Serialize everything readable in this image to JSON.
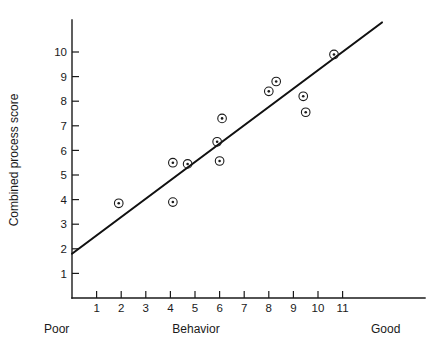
{
  "chart_data": {
    "type": "scatter",
    "title": "",
    "xlabel": "Behavior",
    "ylabel": "Combined process score",
    "xlim": [
      0,
      14.6
    ],
    "ylim": [
      0,
      11.6
    ],
    "grid": false,
    "legend": null,
    "x_ticks": [
      1,
      2,
      3,
      4,
      5,
      6,
      7,
      8,
      9,
      10,
      11
    ],
    "y_ticks": [
      1,
      2,
      3,
      4,
      5,
      6,
      7,
      8,
      9,
      10
    ],
    "x_axis_low_label": "Poor",
    "x_axis_high_label": "Good",
    "points": [
      {
        "x": 1.9,
        "y": 3.85
      },
      {
        "x": 4.1,
        "y": 3.9
      },
      {
        "x": 4.1,
        "y": 5.5
      },
      {
        "x": 4.7,
        "y": 5.45
      },
      {
        "x": 5.9,
        "y": 6.35
      },
      {
        "x": 6.0,
        "y": 5.57
      },
      {
        "x": 6.1,
        "y": 7.3
      },
      {
        "x": 8.0,
        "y": 8.4
      },
      {
        "x": 8.3,
        "y": 8.8
      },
      {
        "x": 9.4,
        "y": 8.2
      },
      {
        "x": 9.5,
        "y": 7.55
      },
      {
        "x": 10.65,
        "y": 9.9
      }
    ],
    "fit_line": {
      "x1": 0.0,
      "y1": 1.8,
      "x2": 12.6,
      "y2": 11.2
    },
    "marker_style": "circle-with-center-dot",
    "colors": {
      "axis": "#1a1a1a",
      "marker": "#1a1a1a",
      "fit_line": "#111111",
      "background": "#ffffff"
    }
  },
  "axis_labels": {
    "y_title": "Combined process score",
    "x_title": "Behavior",
    "x_low": "Poor",
    "x_high": "Good"
  },
  "y_tick_text": [
    "10",
    "9",
    "8",
    "7",
    "6",
    "5",
    "4",
    "3",
    "2",
    "1"
  ],
  "x_tick_text": [
    "1",
    "2",
    "3",
    "4",
    "5",
    "6",
    "7",
    "8",
    "9",
    "10",
    "11"
  ]
}
